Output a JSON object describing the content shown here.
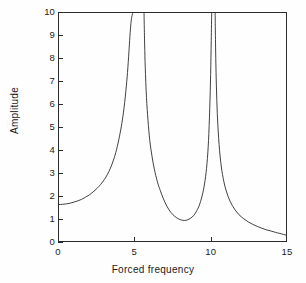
{
  "chart_data": {
    "type": "line",
    "title": "",
    "xlabel": "Forced frequency",
    "ylabel": "Amplitude",
    "xlim": [
      0,
      15
    ],
    "ylim": [
      0,
      10
    ],
    "xticks": [
      0,
      5,
      10,
      15
    ],
    "yticks": [
      0,
      1,
      2,
      3,
      4,
      5,
      6,
      7,
      8,
      9,
      10
    ],
    "xtick_labels": [
      "0",
      "5",
      "10",
      "15"
    ],
    "ytick_labels": [
      "0",
      "1",
      "2",
      "3",
      "4",
      "5",
      "6",
      "7",
      "8",
      "9",
      "10"
    ],
    "grid": false,
    "legend": null,
    "line_color": "#2b2b2b",
    "line_width": 0.9,
    "asymptotes": [
      4.9,
      10.15
    ],
    "annotations": [],
    "series": [
      {
        "name": "amplitude",
        "x": [
          0.0,
          0.25,
          0.5,
          0.75,
          1.0,
          1.25,
          1.5,
          1.75,
          2.0,
          2.25,
          2.5,
          2.75,
          3.0,
          3.2,
          3.4,
          3.6,
          3.8,
          4.0,
          4.15,
          4.3,
          4.45,
          4.55,
          4.65,
          4.72,
          4.78,
          4.83,
          4.86,
          4.885
        ],
        "y": [
          1.6,
          1.61,
          1.63,
          1.66,
          1.71,
          1.76,
          1.83,
          1.92,
          2.02,
          2.15,
          2.3,
          2.48,
          2.7,
          2.92,
          3.2,
          3.55,
          4.0,
          4.6,
          5.15,
          5.85,
          6.8,
          7.6,
          8.6,
          9.3,
          9.7,
          9.9,
          9.97,
          10.0
        ]
      },
      {
        "name": "amplitude-branch-2",
        "x": [
          5.62,
          5.63,
          5.66,
          5.7,
          5.78,
          5.88,
          6.0,
          6.15,
          6.3,
          6.5,
          6.7,
          6.9,
          7.15,
          7.4,
          7.65,
          7.9,
          8.1,
          8.3,
          8.5,
          8.7,
          8.9,
          9.1,
          9.3,
          9.5,
          9.65,
          9.78,
          9.88,
          9.96,
          10.02,
          10.06,
          10.09
        ],
        "y": [
          10.0,
          9.6,
          8.6,
          7.6,
          6.3,
          5.3,
          4.4,
          3.7,
          3.15,
          2.6,
          2.2,
          1.85,
          1.5,
          1.25,
          1.08,
          0.97,
          0.92,
          0.9,
          0.93,
          1.0,
          1.12,
          1.32,
          1.62,
          2.1,
          2.65,
          3.4,
          4.4,
          5.8,
          7.3,
          8.8,
          10.0
        ]
      },
      {
        "name": "amplitude-branch-3",
        "x": [
          10.32,
          10.33,
          10.36,
          10.4,
          10.46,
          10.55,
          10.68,
          10.85,
          11.05,
          11.3,
          11.6,
          11.9,
          12.2,
          12.5,
          12.8,
          13.1,
          13.4,
          13.7,
          14.0,
          14.3,
          14.6,
          15.0
        ],
        "y": [
          10.0,
          9.3,
          8.0,
          6.8,
          5.6,
          4.5,
          3.5,
          2.75,
          2.2,
          1.75,
          1.4,
          1.15,
          0.98,
          0.84,
          0.73,
          0.64,
          0.56,
          0.49,
          0.44,
          0.38,
          0.33,
          0.26
        ]
      }
    ]
  }
}
